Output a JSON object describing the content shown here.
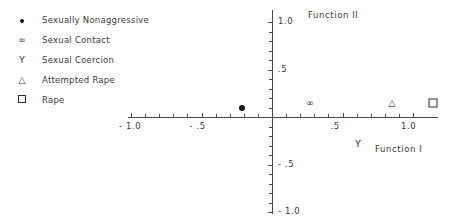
{
  "legend": {
    "items": [
      {
        "symbol": "dot",
        "glyph": "●",
        "label": "Sexually Nonaggressive"
      },
      {
        "symbol": "infinity",
        "glyph": "∞",
        "label": "Sexual Contact"
      },
      {
        "symbol": "upsilon",
        "glyph": "Υ",
        "label": "Sexual Coercion"
      },
      {
        "symbol": "triangle",
        "glyph": "△",
        "label": "Attempted Rape"
      },
      {
        "symbol": "square",
        "glyph": "□",
        "label": "Rape"
      }
    ]
  },
  "chart_data": {
    "type": "scatter",
    "title": "",
    "xlabel": "Function I",
    "ylabel": "Function II",
    "xlim": [
      -1.1,
      1.25
    ],
    "ylim": [
      -1.1,
      1.1
    ],
    "grid": false,
    "legend_position": "upper-left-outside",
    "xticks": [
      -1.0,
      -0.5,
      0.5,
      1.0
    ],
    "xticklabels": [
      "- 1.0",
      "- .5",
      ".5",
      "1.0"
    ],
    "yticks": [
      1.0,
      0.5,
      -0.5,
      -1.0
    ],
    "yticklabels": [
      "1.0",
      ".5",
      "- .5",
      "- 1.0"
    ],
    "points": [
      {
        "name": "Sexually Nonaggressive",
        "marker": "dot",
        "glyph": "●",
        "x": -0.21,
        "y": 0.1
      },
      {
        "name": "Sexual Contact",
        "marker": "infinity",
        "glyph": "∞",
        "x": 0.27,
        "y": 0.15
      },
      {
        "name": "Sexual Coercion",
        "marker": "upsilon",
        "glyph": "Υ",
        "x": 0.61,
        "y": -0.28
      },
      {
        "name": "Attempted Rape",
        "marker": "triangle",
        "glyph": "△",
        "x": 0.85,
        "y": 0.15
      },
      {
        "name": "Rape",
        "marker": "square",
        "glyph": "□",
        "x": 1.14,
        "y": 0.15
      }
    ]
  },
  "axes": {
    "x_title": "Function I",
    "y_title": "Function II",
    "x_labels": [
      {
        "text": "- 1.0",
        "value": -1.0
      },
      {
        "text": "- .5",
        "value": -0.5
      },
      {
        "text": ".5",
        "value": 0.5
      },
      {
        "text": "1.0",
        "value": 1.0
      }
    ],
    "y_labels": [
      {
        "text": "1.0",
        "value": 1.0
      },
      {
        "text": ".5",
        "value": 0.5
      },
      {
        "text": "- .5",
        "value": -0.5
      },
      {
        "text": "- 1.0",
        "value": -1.0
      }
    ]
  }
}
